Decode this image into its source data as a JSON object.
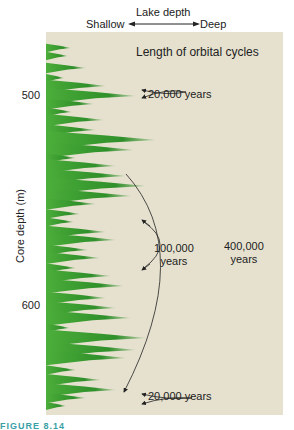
{
  "chart_data": {
    "type": "area",
    "title": "Length of orbital cycles",
    "top_axis": {
      "label": "Lake depth",
      "left": "Shallow",
      "right": "Deep"
    },
    "ylabel": "Core depth (m)",
    "yticks": [
      {
        "label": "500",
        "y": 96
      },
      {
        "label": "600",
        "y": 306
      }
    ],
    "annotations": [
      {
        "text": "20,000 years",
        "x": 196,
        "y": 96
      },
      {
        "text": "100,000\nyears",
        "x": 180,
        "y": 262
      },
      {
        "text": "400,000\nyears",
        "x": 246,
        "y": 255
      },
      {
        "text": "20,000 years",
        "x": 196,
        "y": 398
      }
    ],
    "series": [
      {
        "name": "Lake depth (shallow→deep)",
        "color": "#3a9a2f",
        "spikes": [
          [
            48,
            25
          ],
          [
            56,
            22
          ],
          [
            68,
            40
          ],
          [
            78,
            18
          ],
          [
            86,
            60
          ],
          [
            96,
            90
          ],
          [
            104,
            48
          ],
          [
            112,
            26
          ],
          [
            120,
            58
          ],
          [
            130,
            50
          ],
          [
            140,
            110
          ],
          [
            150,
            88
          ],
          [
            158,
            30
          ],
          [
            166,
            70
          ],
          [
            176,
            80
          ],
          [
            186,
            100
          ],
          [
            196,
            86
          ],
          [
            204,
            50
          ],
          [
            214,
            34
          ],
          [
            222,
            28
          ],
          [
            232,
            60
          ],
          [
            240,
            70
          ],
          [
            250,
            42
          ],
          [
            258,
            54
          ],
          [
            268,
            30
          ],
          [
            276,
            65
          ],
          [
            286,
            78
          ],
          [
            298,
            60
          ],
          [
            308,
            70
          ],
          [
            318,
            85
          ],
          [
            328,
            24
          ],
          [
            338,
            100
          ],
          [
            350,
            90
          ],
          [
            358,
            80
          ],
          [
            370,
            30
          ],
          [
            380,
            55
          ],
          [
            390,
            70
          ],
          [
            398,
            40
          ],
          [
            406,
            20
          ]
        ]
      }
    ]
  },
  "header": {
    "lake_depth": "Lake depth",
    "shallow": "Shallow",
    "deep": "Deep",
    "panel_title": "Length of orbital cycles"
  },
  "axis": {
    "ylabel": "Core depth (m)",
    "tick_500": "500",
    "tick_600": "600"
  },
  "labels": {
    "a1": "20,000 years",
    "a2_line1": "100,000",
    "a2_line2": "years",
    "a3_line1": "400,000",
    "a3_line2": "years",
    "a4": "20,000 years"
  },
  "caption": {
    "figure": "FIGURE 8.14"
  }
}
